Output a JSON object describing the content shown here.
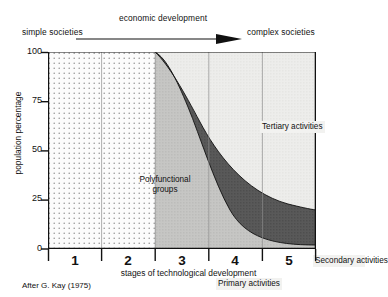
{
  "header": {
    "left_text": "simple societies",
    "arrow_label": "economic development",
    "right_text": "complex societies",
    "arrow_icon": "right-arrow-icon"
  },
  "credit": "After G. Kay (1975)",
  "chart_data": {
    "type": "area",
    "title": "",
    "subtitle": "",
    "xlabel": "stages of technological development",
    "ylabel": "population percentage",
    "xlim": [
      0,
      5
    ],
    "ylim": [
      0,
      100
    ],
    "grid": true,
    "legend_position": "inline-annotations",
    "x_tick_labels": [
      "1",
      "2",
      "3",
      "4",
      "5"
    ],
    "y_tick_labels": [
      "0",
      "25",
      "50",
      "75",
      "100"
    ],
    "y_ticks": [
      0,
      25,
      50,
      75,
      100
    ],
    "annotations": [
      {
        "text": "Polyfunctional groups",
        "stage": 1.6,
        "value": 52
      },
      {
        "text": "Tertiary activities",
        "stage": 3.6,
        "value": 90
      },
      {
        "text": "Primary activities",
        "stage": 3.3,
        "value": 12
      },
      {
        "text": "Secondary activities",
        "stage": 4.7,
        "value": 30
      }
    ],
    "x": [
      0,
      1,
      2,
      2.0,
      2.3,
      2.6,
      3.0,
      3.4,
      3.8,
      4.2,
      4.6,
      5.0
    ],
    "series": [
      {
        "name": "Polyfunctional groups",
        "fill": "dotted",
        "color": "#fbfbfb",
        "values": [
          100,
          100,
          100,
          0,
          0,
          0,
          0,
          0,
          0,
          0,
          0,
          0
        ]
      },
      {
        "name": "Primary activities",
        "fill": "light-grey",
        "color": "#c9c9c9",
        "values": [
          0,
          0,
          0,
          100,
          92,
          82,
          66,
          48,
          30,
          18,
          11,
          8
        ]
      },
      {
        "name": "Secondary activities",
        "fill": "dark-grey",
        "color": "#5a5a5a",
        "values": [
          0,
          0,
          0,
          0,
          4,
          9,
          17,
          25,
          30,
          28,
          23,
          17
        ]
      },
      {
        "name": "Tertiary activities",
        "fill": "pale-grey",
        "color": "#ececea",
        "values": [
          0,
          0,
          0,
          0,
          4,
          9,
          17,
          27,
          40,
          54,
          66,
          75
        ]
      }
    ]
  }
}
